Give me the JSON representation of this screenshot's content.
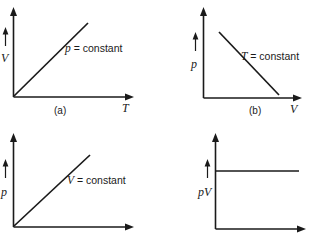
{
  "figure": {
    "background_color": "#ffffff",
    "line_color": "#1a1a1a"
  },
  "panels": [
    {
      "id": "panel-a",
      "letter": "(a)",
      "y_axis_label": "V",
      "x_axis_label": "T",
      "annotation_var": "p",
      "annotation_rest": " = constant",
      "relation": "linear-increasing-through-origin"
    },
    {
      "id": "panel-b",
      "letter": "(b)",
      "y_axis_label": "p",
      "x_axis_label": "V",
      "annotation_var": "T",
      "annotation_rest": " = constant",
      "relation": "linear-decreasing"
    },
    {
      "id": "panel-c",
      "letter": "",
      "y_axis_label": "p",
      "x_axis_label": "",
      "annotation_var": "V",
      "annotation_rest": " = constant",
      "relation": "linear-increasing-through-origin"
    },
    {
      "id": "panel-d",
      "letter": "",
      "y_axis_label": "pV",
      "x_axis_label": "",
      "annotation_var": "",
      "annotation_rest": "",
      "relation": "horizontal-constant"
    }
  ]
}
